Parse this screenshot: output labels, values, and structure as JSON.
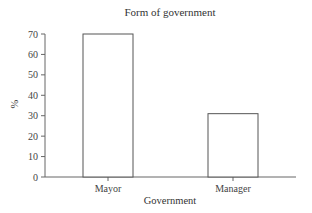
{
  "chart_data": {
    "type": "bar",
    "title": "Form of government",
    "xlabel": "Government",
    "ylabel": "%",
    "categories": [
      "Mayor",
      "Manager"
    ],
    "values": [
      70,
      31
    ],
    "ylim": [
      0,
      70
    ],
    "yticks": [
      0,
      10,
      20,
      30,
      40,
      50,
      60,
      70
    ],
    "grid": false,
    "legend": null,
    "colors": {
      "bar_fill": "#ffffff",
      "bar_stroke": "#555555",
      "axis": "#666666"
    }
  }
}
